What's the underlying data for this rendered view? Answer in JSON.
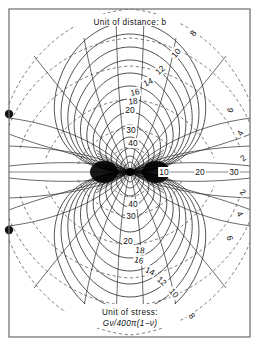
{
  "figure": {
    "caption_top": "Unit of distance: b",
    "caption_bottom_line1": "Unit of stress:",
    "caption_bottom_line2": "Gν/400π(1−ν)",
    "frame_color": "#6b6b6b",
    "solid_contour_color": "#1a1a1a",
    "dashed_contour_color": "#4a4a4a",
    "marker_color": "#111111",
    "background": "#ffffff"
  },
  "chart_data": {
    "type": "line",
    "subtitle": "Unit of distance: b — Unit of stress: Gν/400π(1−ν)",
    "xlabel": "",
    "ylabel": "",
    "xlim": [
      -6.2,
      6.2
    ],
    "ylim": [
      -8.5,
      8.5
    ],
    "grid": false,
    "legend": "none",
    "singularity": {
      "x": 0,
      "y": 0,
      "label": "center dipole"
    },
    "axis_line": {
      "orientation": "horizontal",
      "y": 0
    },
    "markers": [
      {
        "name": "left-marker-upper",
        "x": -6.0,
        "y": 2.35,
        "shape": "filled-circle"
      },
      {
        "name": "left-marker-lower",
        "x": -6.0,
        "y": -2.35,
        "shape": "filled-circle"
      }
    ],
    "series": [
      {
        "name": "stress contours (solid)",
        "style": "solid",
        "levels": [
          10,
          12,
          14,
          16,
          18,
          20,
          30,
          40
        ],
        "labels_upper": [
          "12",
          "14",
          "16",
          "18",
          "20",
          "30",
          "40"
        ],
        "labels_lower": [
          "40",
          "30",
          "20",
          "18",
          "16",
          "14",
          "12",
          "10"
        ],
        "labels_axis_right": [
          "10",
          "20",
          "30"
        ]
      },
      {
        "name": "distance contours (dashed)",
        "style": "dashed",
        "levels": [
          2,
          4,
          6,
          8,
          10
        ],
        "labels_upper_right": [
          "8",
          "6",
          "4",
          "2"
        ],
        "labels_lower_right": [
          "2",
          "4",
          "6",
          "8"
        ],
        "labels_upper": [
          "10",
          "12"
        ],
        "labels_lower": [
          "10"
        ]
      }
    ],
    "contour_labels": [
      {
        "text": "8",
        "x": 193,
        "y": 33,
        "rot": -52
      },
      {
        "text": "10",
        "x": 176,
        "y": 53,
        "rot": -50
      },
      {
        "text": "12",
        "x": 160,
        "y": 70,
        "rot": -42
      },
      {
        "text": "14",
        "x": 148,
        "y": 82,
        "rot": -28
      },
      {
        "text": "16",
        "x": 135,
        "y": 92,
        "rot": -12
      },
      {
        "text": "18",
        "x": 133,
        "y": 101,
        "rot": -6
      },
      {
        "text": "20",
        "x": 130,
        "y": 110,
        "rot": 0
      },
      {
        "text": "30",
        "x": 131,
        "y": 130,
        "rot": 0
      },
      {
        "text": "40",
        "x": 133,
        "y": 143,
        "rot": 0
      },
      {
        "text": "6",
        "x": 230,
        "y": 110,
        "rot": -78
      },
      {
        "text": "4",
        "x": 240,
        "y": 133,
        "rot": -64
      },
      {
        "text": "2",
        "x": 243,
        "y": 158,
        "rot": -42
      },
      {
        "text": "10",
        "x": 164,
        "y": 172,
        "rot": 0
      },
      {
        "text": "20",
        "x": 200,
        "y": 172,
        "rot": 0
      },
      {
        "text": "30",
        "x": 234,
        "y": 172,
        "rot": 0
      },
      {
        "text": "2",
        "x": 243,
        "y": 192,
        "rot": 42
      },
      {
        "text": "4",
        "x": 240,
        "y": 214,
        "rot": 62
      },
      {
        "text": "6",
        "x": 230,
        "y": 238,
        "rot": 76
      },
      {
        "text": "40",
        "x": 133,
        "y": 204,
        "rot": 0
      },
      {
        "text": "30",
        "x": 131,
        "y": 216,
        "rot": 0
      },
      {
        "text": "20",
        "x": 128,
        "y": 241,
        "rot": 0
      },
      {
        "text": "18",
        "x": 140,
        "y": 250,
        "rot": 6
      },
      {
        "text": "16",
        "x": 139,
        "y": 260,
        "rot": 12
      },
      {
        "text": "14",
        "x": 150,
        "y": 271,
        "rot": 26
      },
      {
        "text": "12",
        "x": 162,
        "y": 281,
        "rot": 40
      },
      {
        "text": "10",
        "x": 174,
        "y": 293,
        "rot": 48
      },
      {
        "text": "8",
        "x": 192,
        "y": 316,
        "rot": 54
      }
    ]
  }
}
